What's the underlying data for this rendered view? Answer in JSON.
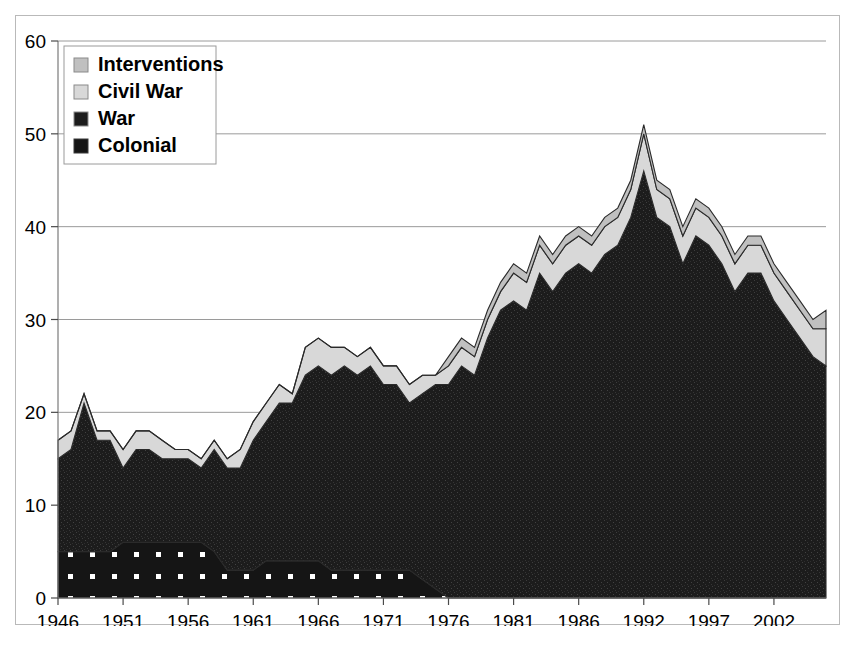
{
  "chart_data": {
    "type": "area",
    "stacked": true,
    "title": "",
    "xlabel": "",
    "ylabel": "",
    "xlim": [
      1946,
      2005
    ],
    "ylim": [
      0,
      60
    ],
    "ytick_labels": [
      "0",
      "10",
      "20",
      "30",
      "40",
      "50",
      "60"
    ],
    "ytick_values": [
      0,
      10,
      20,
      30,
      40,
      50,
      60
    ],
    "xtick_labels": [
      "1946",
      "1951",
      "1956",
      "1961",
      "1966",
      "1971",
      "1976",
      "1981",
      "1986",
      "1992",
      "1997",
      "2002"
    ],
    "xtick_values": [
      1946,
      1951,
      1956,
      1961,
      1966,
      1971,
      1976,
      1981,
      1986,
      1991,
      1996,
      2001
    ],
    "grid": "horizontal",
    "legend_position": "top-left",
    "x": [
      1946,
      1947,
      1948,
      1949,
      1950,
      1951,
      1952,
      1953,
      1954,
      1955,
      1956,
      1957,
      1958,
      1959,
      1960,
      1961,
      1962,
      1963,
      1964,
      1965,
      1966,
      1967,
      1968,
      1969,
      1970,
      1971,
      1972,
      1973,
      1974,
      1975,
      1976,
      1977,
      1978,
      1979,
      1980,
      1981,
      1982,
      1983,
      1984,
      1985,
      1986,
      1987,
      1988,
      1989,
      1990,
      1991,
      1992,
      1993,
      1994,
      1995,
      1996,
      1997,
      1998,
      1999,
      2000,
      2001,
      2002,
      2003,
      2004,
      2005
    ],
    "series": [
      {
        "name": "Colonial",
        "fill": "#ffffff",
        "pattern": "dots",
        "values": [
          5,
          5,
          5,
          5,
          5,
          6,
          6,
          6,
          6,
          6,
          6,
          6,
          5,
          3,
          3,
          3,
          4,
          4,
          4,
          4,
          4,
          3,
          3,
          3,
          3,
          3,
          3,
          3,
          2,
          1,
          0,
          0,
          0,
          0,
          0,
          0,
          0,
          0,
          0,
          0,
          0,
          0,
          0,
          0,
          0,
          0,
          0,
          0,
          0,
          0,
          0,
          0,
          0,
          0,
          0,
          0,
          0,
          0,
          0,
          0
        ]
      },
      {
        "name": "War",
        "fill": "#1c1c1c",
        "pattern": "noise",
        "values": [
          10,
          11,
          16,
          12,
          12,
          8,
          10,
          10,
          9,
          9,
          9,
          8,
          11,
          11,
          11,
          14,
          15,
          17,
          17,
          20,
          21,
          21,
          22,
          21,
          22,
          20,
          20,
          18,
          20,
          22,
          23,
          25,
          24,
          28,
          31,
          32,
          31,
          35,
          33,
          35,
          36,
          35,
          37,
          38,
          41,
          46,
          41,
          40,
          36,
          39,
          38,
          36,
          33,
          35,
          35,
          32,
          30,
          28,
          26,
          25
        ]
      },
      {
        "name": "Civil War",
        "fill": "#d8d8d8",
        "pattern": "solid",
        "values": [
          2,
          2,
          1,
          1,
          1,
          2,
          2,
          2,
          2,
          1,
          1,
          1,
          1,
          1,
          2,
          2,
          2,
          2,
          1,
          3,
          3,
          3,
          2,
          2,
          2,
          2,
          2,
          2,
          2,
          1,
          2,
          2,
          2,
          2,
          2,
          3,
          3,
          3,
          3,
          3,
          3,
          3,
          3,
          3,
          3,
          4,
          3,
          3,
          3,
          3,
          3,
          3,
          3,
          3,
          3,
          3,
          3,
          3,
          3,
          4
        ]
      },
      {
        "name": "Interventions",
        "fill": "#c0c0c0",
        "pattern": "solid",
        "values": [
          0,
          0,
          0,
          0,
          0,
          0,
          0,
          0,
          0,
          0,
          0,
          0,
          0,
          0,
          0,
          0,
          0,
          0,
          0,
          0,
          0,
          0,
          0,
          0,
          0,
          0,
          0,
          0,
          0,
          0,
          1,
          1,
          1,
          1,
          1,
          1,
          1,
          1,
          1,
          1,
          1,
          1,
          1,
          1,
          1,
          1,
          1,
          1,
          1,
          1,
          1,
          1,
          1,
          1,
          1,
          1,
          1,
          1,
          1,
          2
        ]
      }
    ]
  },
  "legend": {
    "items": [
      {
        "label": "Interventions",
        "swatch": "#c0c0c0"
      },
      {
        "label": "Civil War",
        "swatch": "#d8d8d8"
      },
      {
        "label": "War",
        "swatch": "#1c1c1c"
      },
      {
        "label": "Colonial",
        "swatch": "#ffffff"
      }
    ]
  },
  "colors": {
    "background": "#ffffff",
    "frame_border": "#b9b9b9",
    "grid": "#9a9a9a",
    "axis": "#7a7a7a",
    "outline": "#2a2a2a"
  }
}
